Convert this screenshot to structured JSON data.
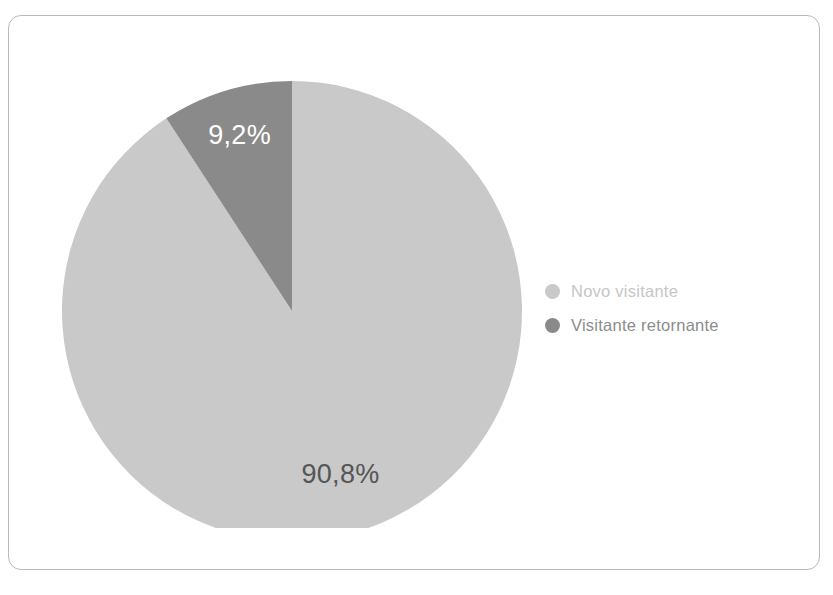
{
  "card": {
    "border_color": "#b9b9b9",
    "background": "#ffffff"
  },
  "legend": {
    "items": [
      {
        "label": "Novo visitante",
        "color": "#c9c9c9",
        "text_color": "#c6c6c6"
      },
      {
        "label": "Visitante retornante",
        "color": "#8a8a8a",
        "text_color": "#8c8c8c"
      }
    ]
  },
  "labels": {
    "major": "90,8%",
    "minor": "9,2%",
    "major_color": "#555555",
    "minor_color": "#ffffff"
  },
  "chart_data": {
    "type": "pie",
    "title": "",
    "categories": [
      "Novo visitante",
      "Visitante retornante"
    ],
    "values": [
      90.8,
      9.2
    ],
    "value_labels": [
      "90,8%",
      "9,2%"
    ],
    "colors": [
      "#c9c9c9",
      "#8a8a8a"
    ],
    "unit": "%",
    "start_angle_deg": 0,
    "direction": "clockwise-major-counterclockwise-minor",
    "legend_position": "right",
    "grid": false,
    "donut": false
  }
}
